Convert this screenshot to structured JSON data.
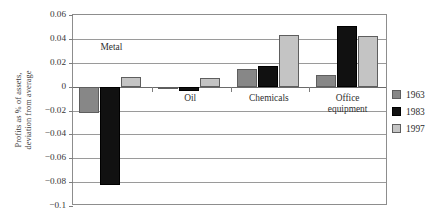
{
  "chart_data": {
    "type": "bar",
    "title": "",
    "xlabel": "",
    "ylabel": "Profits as % of assets,\ndeviation from average",
    "categories": [
      "Metal",
      "Oil",
      "Chemicals",
      "Office\nequipment"
    ],
    "series": [
      {
        "name": "1963",
        "color": "#878787",
        "values": [
          -0.022,
          -0.002,
          0.015,
          0.01
        ]
      },
      {
        "name": "1983",
        "color": "#111111",
        "values": [
          -0.082,
          -0.004,
          0.017,
          0.051
        ]
      },
      {
        "name": "1997",
        "color": "#c4c4c4",
        "values": [
          0.008,
          0.007,
          0.043,
          0.042
        ]
      }
    ],
    "ylim": [
      -0.1,
      0.06
    ],
    "ytick_values": [
      0.06,
      0.04,
      0.02,
      0,
      -0.02,
      -0.04,
      -0.06,
      -0.08,
      -0.1
    ],
    "ytick_labels": [
      "0.06",
      "0.04",
      "0.02",
      "0",
      "−0.02",
      "−0.04",
      "−0.06",
      "−0.08",
      "−0.1"
    ],
    "grid": true,
    "legend_position": "right",
    "legend_entries": [
      "1963",
      "1983",
      "1997"
    ]
  }
}
